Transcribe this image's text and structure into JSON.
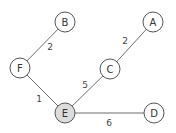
{
  "graph": {
    "nodes": [
      {
        "id": "A",
        "label": "A",
        "x": 153,
        "y": 22,
        "fill": "#ffffff"
      },
      {
        "id": "B",
        "label": "B",
        "x": 65,
        "y": 22,
        "fill": "#ffffff"
      },
      {
        "id": "C",
        "label": "C",
        "x": 110,
        "y": 69,
        "fill": "#ffffff"
      },
      {
        "id": "D",
        "label": "D",
        "x": 154,
        "y": 113,
        "fill": "#ffffff"
      },
      {
        "id": "E",
        "label": "E",
        "x": 65,
        "y": 113,
        "fill": "#dcdcdc"
      },
      {
        "id": "F",
        "label": "F",
        "x": 20,
        "y": 68,
        "fill": "#ffffff"
      }
    ],
    "edges": [
      {
        "from": "B",
        "to": "F",
        "weight": "2",
        "lx": 50,
        "ly": 50
      },
      {
        "from": "A",
        "to": "C",
        "weight": "2",
        "lx": 125,
        "ly": 44
      },
      {
        "from": "C",
        "to": "E",
        "weight": "5",
        "lx": 85,
        "ly": 88
      },
      {
        "from": "F",
        "to": "E",
        "weight": "1",
        "lx": 39,
        "ly": 102
      },
      {
        "from": "E",
        "to": "D",
        "weight": "6",
        "lx": 109,
        "ly": 126
      }
    ],
    "highlighted_node": "E"
  }
}
